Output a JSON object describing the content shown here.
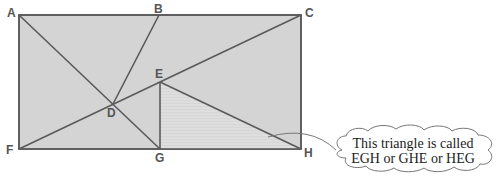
{
  "diagram": {
    "colors": {
      "fill": "#d4d4d4",
      "triangle_fill": "#dcdcdc",
      "stroke": "#5a5a5a",
      "label": "#555555",
      "callout_stroke": "#666666"
    },
    "points": {
      "A": {
        "label": "A",
        "x": 19,
        "y": 15
      },
      "B": {
        "label": "B",
        "x": 159,
        "y": 15
      },
      "C": {
        "label": "C",
        "x": 301,
        "y": 15
      },
      "D": {
        "label": "D",
        "x": 113,
        "y": 104
      },
      "E": {
        "label": "E",
        "x": 160,
        "y": 82
      },
      "F": {
        "label": "F",
        "x": 19,
        "y": 149
      },
      "G": {
        "label": "G",
        "x": 160,
        "y": 149
      },
      "H": {
        "label": "H",
        "x": 301,
        "y": 149
      }
    },
    "segments": [
      "AG",
      "BD",
      "FC",
      "EG",
      "EH"
    ],
    "highlighted_triangle": "EGH",
    "callout": {
      "line1": "This triangle is called",
      "line2": "EGH or GHE or HEG"
    }
  }
}
